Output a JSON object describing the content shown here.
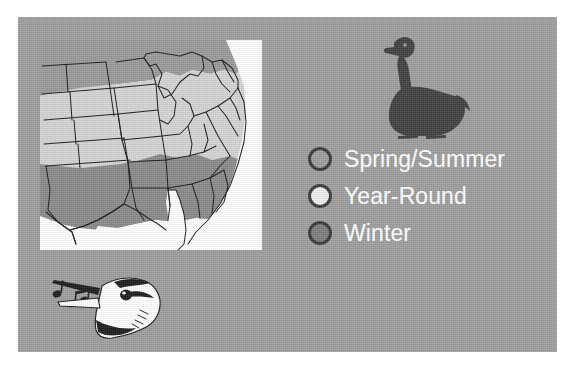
{
  "panel": {
    "background_color": "#9e9e9e",
    "page_background_color": "#ffffff"
  },
  "map": {
    "name": "us-range-map",
    "description": "Range map of the central and eastern United States with state outlines, shaded in three gray bands",
    "background_color": "#ffffff",
    "outline_color": "#1d1d1d",
    "bands": [
      {
        "key": "spring_summer",
        "label": "Spring/Summer",
        "color": "#9a9a9a",
        "region": "northern states"
      },
      {
        "key": "year_round",
        "label": "Year-Round",
        "color": "#d4d4d4",
        "region": "central states"
      },
      {
        "key": "winter",
        "label": "Winter",
        "color": "#8a8a8a",
        "region": "southern states"
      }
    ]
  },
  "goose": {
    "name": "canada-goose-silhouette",
    "color": "#414141",
    "facing": "left"
  },
  "singing_bird": {
    "name": "singing-bird-head",
    "body_color": "#ffffff",
    "marking_color": "#1d1d1d",
    "note_color": "#1d1d1d",
    "notes_count": 2
  },
  "legend": {
    "title": "",
    "items": [
      {
        "label": "Spring/Summer",
        "swatch_color": "#9e9e9e",
        "swatch_border": "#3a3a3a",
        "icon": "circle-icon"
      },
      {
        "label": "Year-Round",
        "swatch_color": "#eeeeee",
        "swatch_border": "#3a3a3a",
        "icon": "circle-icon"
      },
      {
        "label": "Winter",
        "swatch_color": "#7e7e7e",
        "swatch_border": "#3a3a3a",
        "icon": "circle-icon"
      }
    ],
    "text_color": "#ffffff"
  }
}
